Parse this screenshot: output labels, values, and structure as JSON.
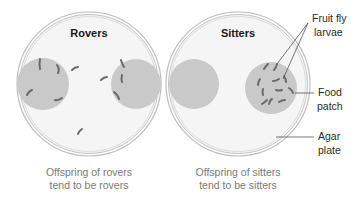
{
  "plates": [
    {
      "title": "Rovers",
      "caption_line1": "Offspring of rovers",
      "caption_line2": "tend to be rovers"
    },
    {
      "title": "Sitters",
      "caption_line1": "Offspring of sitters",
      "caption_line2": "tend to be sitters"
    }
  ],
  "annotations": {
    "larvae_line1": "Fruit fly",
    "larvae_line2": "larvae",
    "food_line1": "Food",
    "food_line2": "patch",
    "agar_line1": "Agar",
    "agar_line2": "plate"
  },
  "colors": {
    "plate_fill": "#f4f4f4",
    "plate_rim": "#b8b8b8",
    "food_patch": "#c9c9c9",
    "larva": "#6a6a6a",
    "leader_line": "#555555"
  }
}
